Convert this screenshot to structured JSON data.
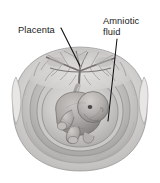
{
  "figure": {
    "background_color": "#ffffff",
    "ink_color": "#1a1a1a",
    "style": "grayscale pencil-shaded medical illustration"
  },
  "labels": {
    "placenta": {
      "text": "Placenta",
      "lines": [
        "Placenta"
      ]
    },
    "amniotic_fluid": {
      "text": "Amniotic fluid",
      "line1": "Amniotic",
      "line2": "fluid"
    }
  },
  "anatomy": {
    "uterus_wall": "uterine wall layers",
    "placenta_tree": "placental vascular tree",
    "umbilical_cord": "umbilical cord",
    "fetus": "fetus",
    "fetal_head": "fetal head",
    "fetal_eye": "fetal eye",
    "amniotic_cavity": "amniotic cavity"
  },
  "palette": {
    "wall_light": "#e2e1e0",
    "wall_mid": "#c9c7c6",
    "wall_dark": "#a9a7a6",
    "cavity": "#d6d4d3",
    "fetus_body": "#a3a09e",
    "fetus_light": "#c5c2c0",
    "fetus_shadow": "#7d7a78",
    "line_dark": "#5b5856",
    "placenta_tissue": "#cfcdcc"
  }
}
